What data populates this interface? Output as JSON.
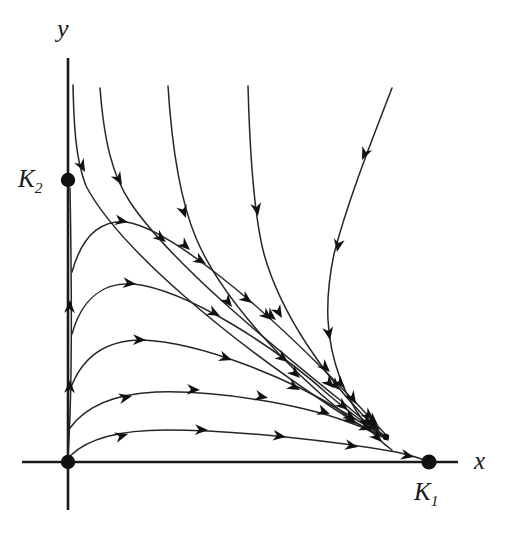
{
  "figure": {
    "kind": "phase-portrait",
    "background_color": "#ffffff",
    "curve_color": "#262626",
    "axis_color": "#1a1a1a",
    "point_color": "#111111"
  },
  "axes": {
    "x_label": "x",
    "y_label": "y",
    "origin": {
      "x": 68,
      "y": 462
    },
    "x_axis": {
      "x1": 22,
      "y1": 462,
      "x2": 458,
      "y2": 462
    },
    "y_axis": {
      "x1": 68,
      "y1": 58,
      "x2": 68,
      "y2": 510
    }
  },
  "equilibria": [
    {
      "name": "origin",
      "label": "",
      "x": 68,
      "y": 462,
      "radius": 7.2,
      "type": "unstable-node"
    },
    {
      "name": "K2-point",
      "label": "K",
      "subscript": "2",
      "x": 68,
      "y": 180,
      "radius": 7.2,
      "type": "saddle"
    },
    {
      "name": "K1-point",
      "label": "K",
      "subscript": "1",
      "x": 429,
      "y": 462,
      "radius": 7.6,
      "type": "stable-node"
    },
    {
      "name": "interior-dot",
      "label": "",
      "x": 386,
      "y": 437,
      "radius": 3.2,
      "type": "trajectory-terminus"
    }
  ],
  "labels": {
    "k1": "K",
    "k1_sub": "1",
    "k2": "K",
    "k2_sub": "2",
    "x": "x",
    "y": "y"
  },
  "chart_data": {
    "type": "line",
    "title": "",
    "xlabel": "x",
    "ylabel": "y",
    "grid": false,
    "legend": null,
    "annotations": [
      {
        "text": "K",
        "sub": "2",
        "at": [
          68,
          180
        ],
        "placement": "left-of-axis"
      },
      {
        "text": "K",
        "sub": "1",
        "at": [
          429,
          462
        ],
        "placement": "below-axis"
      },
      {
        "text": "x",
        "at": [
          483,
          462
        ],
        "placement": "axis-end"
      },
      {
        "text": "y",
        "at": [
          68,
          35
        ],
        "placement": "axis-end"
      }
    ],
    "series": [
      {
        "name": "y-axis-separatrix-up",
        "direction": "upward",
        "path": "M 68 455 C 72 400 72 300 70 188",
        "arrows": [
          {
            "x": 70,
            "y": 300,
            "angle": -88
          },
          {
            "x": 70,
            "y": 380,
            "angle": -88
          }
        ]
      },
      {
        "name": "trajectory-near-axis-top",
        "direction": "down-right",
        "path": "M 73 85 C 74 130 76 160 86 186 C 120 250 230 340 330 406 C 360 426 375 434 384 437",
        "arrows": [
          {
            "x": 85,
            "y": 172,
            "angle": 62
          },
          {
            "x": 166,
            "y": 242,
            "angle": 38
          },
          {
            "x": 252,
            "y": 303,
            "angle": 36
          },
          {
            "x": 330,
            "y": 372,
            "angle": 44
          },
          {
            "x": 374,
            "y": 420,
            "angle": 40
          }
        ]
      },
      {
        "name": "trajectory-left-down",
        "direction": "down-right",
        "path": "M 100 88 C 104 140 112 175 130 202 C 170 262 268 342 340 400 C 362 419 376 430 385 436",
        "arrows": [
          {
            "x": 122,
            "y": 185,
            "angle": 60
          },
          {
            "x": 190,
            "y": 250,
            "angle": 42
          },
          {
            "x": 276,
            "y": 320,
            "angle": 40
          },
          {
            "x": 345,
            "y": 388,
            "angle": 46
          },
          {
            "x": 378,
            "y": 425,
            "angle": 42
          }
        ]
      },
      {
        "name": "trajectory-mid-left-down",
        "direction": "down-right",
        "path": "M 168 86 C 172 150 180 200 196 238 C 222 300 290 370 342 412 C 362 428 378 436 386 438",
        "arrows": [
          {
            "x": 186,
            "y": 218,
            "angle": 70
          },
          {
            "x": 232,
            "y": 307,
            "angle": 52
          },
          {
            "x": 300,
            "y": 378,
            "angle": 43
          },
          {
            "x": 356,
            "y": 424,
            "angle": 38
          }
        ]
      },
      {
        "name": "trajectory-mid-right-down",
        "direction": "down-right",
        "path": "M 248 86 C 250 160 254 216 264 254 C 282 318 328 378 360 412 C 375 428 384 436 388 440",
        "arrows": [
          {
            "x": 258,
            "y": 216,
            "angle": 80
          },
          {
            "x": 282,
            "y": 318,
            "angle": 60
          },
          {
            "x": 334,
            "y": 388,
            "angle": 46
          },
          {
            "x": 372,
            "y": 426,
            "angle": 42
          }
        ]
      },
      {
        "name": "trajectory-far-right-down",
        "direction": "down-left-then-down-right",
        "path": "M 392 88 C 372 140 348 200 334 254 C 324 302 326 340 340 378 C 352 410 372 436 392 450",
        "arrows": [
          {
            "x": 362,
            "y": 160,
            "angle": 114
          },
          {
            "x": 337,
            "y": 252,
            "angle": 100
          },
          {
            "x": 330,
            "y": 340,
            "angle": 80
          },
          {
            "x": 356,
            "y": 404,
            "angle": 58
          },
          {
            "x": 382,
            "y": 442,
            "angle": 44
          }
        ]
      },
      {
        "name": "trajectory-hump-high",
        "direction": "right-descending",
        "path": "M 72 272 C 82 236 100 220 126 222 C 168 228 254 300 322 368 C 352 398 376 424 386 435",
        "arrows": [
          {
            "x": 128,
            "y": 222,
            "angle": 10
          },
          {
            "x": 206,
            "y": 264,
            "angle": 32
          },
          {
            "x": 272,
            "y": 320,
            "angle": 40
          },
          {
            "x": 340,
            "y": 390,
            "angle": 46
          },
          {
            "x": 378,
            "y": 428,
            "angle": 44
          }
        ]
      },
      {
        "name": "trajectory-hump-mid",
        "direction": "right-descending",
        "path": "M 72 334 C 82 298 104 282 134 284 C 186 290 272 344 330 396 C 356 418 378 432 386 437",
        "arrows": [
          {
            "x": 136,
            "y": 284,
            "angle": 6
          },
          {
            "x": 220,
            "y": 316,
            "angle": 28
          },
          {
            "x": 288,
            "y": 362,
            "angle": 37
          },
          {
            "x": 348,
            "y": 410,
            "angle": 40
          },
          {
            "x": 380,
            "y": 430,
            "angle": 34
          }
        ]
      },
      {
        "name": "trajectory-hump-low",
        "direction": "right-descending",
        "path": "M 70 390 C 82 356 106 340 142 340 C 200 342 288 378 340 410 C 364 424 380 434 386 438",
        "arrows": [
          {
            "x": 146,
            "y": 340,
            "angle": 2
          },
          {
            "x": 232,
            "y": 360,
            "angle": 18
          },
          {
            "x": 300,
            "y": 390,
            "angle": 28
          },
          {
            "x": 356,
            "y": 420,
            "angle": 30
          }
        ]
      },
      {
        "name": "trajectory-flat-upper",
        "direction": "right",
        "path": "M 70 428 C 86 406 114 394 156 392 C 216 390 300 404 348 422 C 370 430 382 435 387 438",
        "arrows": [
          {
            "x": 132,
            "y": 396,
            "angle": -12
          },
          {
            "x": 200,
            "y": 390,
            "angle": 3
          },
          {
            "x": 268,
            "y": 398,
            "angle": 12
          },
          {
            "x": 330,
            "y": 414,
            "angle": 20
          },
          {
            "x": 372,
            "y": 430,
            "angle": 22
          }
        ]
      },
      {
        "name": "trajectory-flat-lower",
        "direction": "right-to-K1",
        "path": "M 70 456 C 88 438 120 430 166 430 C 240 430 340 442 396 452 C 414 456 422 459 427 461",
        "arrows": [
          {
            "x": 128,
            "y": 434,
            "angle": -16
          },
          {
            "x": 208,
            "y": 430,
            "angle": 2
          },
          {
            "x": 286,
            "y": 437,
            "angle": 8
          },
          {
            "x": 358,
            "y": 447,
            "angle": 11
          },
          {
            "x": 414,
            "y": 457,
            "angle": 12
          }
        ]
      }
    ]
  }
}
